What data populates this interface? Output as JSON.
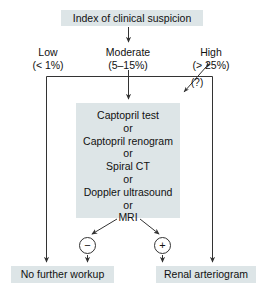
{
  "diagram": {
    "title_node": {
      "label": "Index of clinical suspicion"
    },
    "branches": [
      {
        "name": "low",
        "label": "Low\n(< 1%)"
      },
      {
        "name": "moderate",
        "label": "Moderate\n(5–15%)"
      },
      {
        "name": "high",
        "label": "High\n(> 25%)"
      }
    ],
    "uncertain_marker": "(?)",
    "test_node": {
      "label": "Captopril test\nor\nCaptopril renogram\nor\nSpiral CT\nor\nDoppler ultrasound\nor\nMRI"
    },
    "results": [
      {
        "name": "negative",
        "symbol": "−"
      },
      {
        "name": "positive",
        "symbol": "+"
      }
    ],
    "outcomes": [
      {
        "name": "no-further-workup",
        "label": "No further workup"
      },
      {
        "name": "renal-arteriogram",
        "label": "Renal arteriogram"
      }
    ],
    "colors": {
      "node_fill": "#dde5e7",
      "line": "#333333",
      "text": "#111111",
      "background": "#ffffff"
    }
  }
}
